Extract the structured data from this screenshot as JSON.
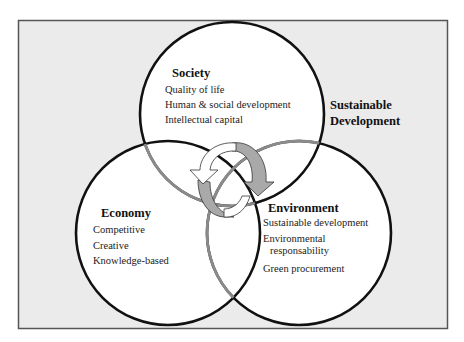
{
  "title": {
    "line1": "Sustainable",
    "line2": "Development"
  },
  "circles": [
    {
      "id": "society",
      "heading": "Society",
      "items": [
        "Quality of life",
        "Human & social development",
        "Intellectual capital"
      ]
    },
    {
      "id": "economy",
      "heading": "Economy",
      "items": [
        "Competitive",
        "Creative",
        "Knowledge-based"
      ]
    },
    {
      "id": "environment",
      "heading": "Environment",
      "items": [
        "Sustainable development",
        "Environmental",
        "responsability",
        "Green procurement"
      ]
    }
  ],
  "colors": {
    "background": "#ebebeb",
    "circle_fill": "#ffffff",
    "outline": "#111111",
    "overlap_outline": "#8a8a8a",
    "arrow_gray": "#a9a9a9",
    "arrow_white": "#ffffff",
    "frame": "#555555"
  },
  "center_icon": "cycle-arrows-icon"
}
